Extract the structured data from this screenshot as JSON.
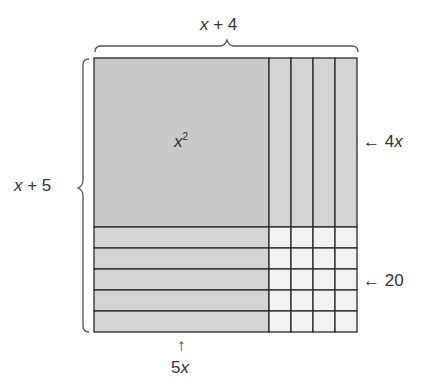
{
  "diagram": {
    "top_label": {
      "var": "x",
      "rest": " + 4"
    },
    "left_label": {
      "var": "x",
      "rest": " + 5"
    },
    "square_label": {
      "base": "x",
      "exp": "2"
    },
    "right_label_upper": {
      "arrow": "←",
      "coef": "4",
      "var": "x"
    },
    "right_label_lower": {
      "arrow": "←",
      "value": "20"
    },
    "bottom_label": {
      "arrow": "↑",
      "coef": "5",
      "var": "x"
    },
    "strip_columns": 4,
    "strip_rows": 5,
    "colors": {
      "square_fill": "#c9c9c9",
      "strip_fill": "#d4d4d4",
      "unit_fill": "#f2f2f2",
      "line": "#2a2a2a",
      "text": "#333333"
    }
  }
}
